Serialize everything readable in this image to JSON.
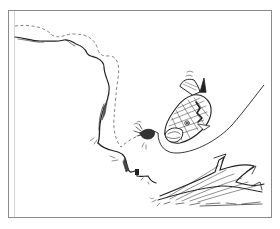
{
  "illustration": {
    "subject": "Fish striking a lure near a submerged brush pile along a drop-off",
    "elements": [
      {
        "name": "shoreline-contour",
        "style": "solid"
      },
      {
        "name": "depth-contour",
        "style": "dashed"
      },
      {
        "name": "fish",
        "description": "largemouth bass, mouth open"
      },
      {
        "name": "lure",
        "description": "jig with skirt"
      },
      {
        "name": "fishing-line",
        "style": "solid curve"
      },
      {
        "name": "brush-pile",
        "description": "sunken tree limbs"
      }
    ],
    "colors": {
      "background": "#ffffff",
      "frame": "#8a8a8a",
      "ink": "#222222",
      "dashed": "#777777"
    }
  }
}
